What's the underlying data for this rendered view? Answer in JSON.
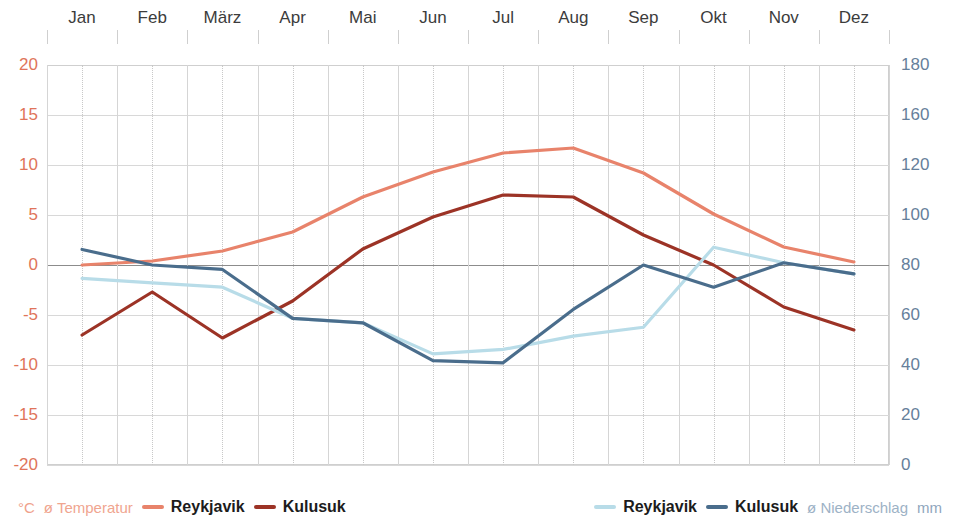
{
  "chart_data": {
    "type": "line",
    "title": "",
    "xlabel": "",
    "categories": [
      "Jan",
      "Feb",
      "März",
      "Apr",
      "Mai",
      "Jun",
      "Jul",
      "Aug",
      "Sep",
      "Okt",
      "Nov",
      "Dez"
    ],
    "left_axis": {
      "label": "°C",
      "caption": "ø Temperatur",
      "ticks": [
        20,
        15,
        10,
        5,
        0,
        -5,
        -10,
        -15,
        -20
      ],
      "ylim": [
        -20,
        20
      ],
      "color": "#e0745a"
    },
    "right_axis": {
      "label": "mm",
      "caption": "ø Niederschlag",
      "ticks": [
        180,
        160,
        120,
        100,
        80,
        60,
        40,
        20,
        0
      ],
      "ylim": [
        0,
        180
      ],
      "color": "#66809b"
    },
    "grid": true,
    "legend_position": "bottom",
    "series": [
      {
        "name": "Reykjavik",
        "axis": "left",
        "unit": "°C",
        "group": "ø Temperatur",
        "color": "#e8836b",
        "values": [
          0.0,
          0.4,
          1.4,
          3.3,
          6.8,
          9.3,
          11.2,
          11.7,
          9.2,
          5.1,
          1.8,
          0.3
        ]
      },
      {
        "name": "Kulusuk",
        "axis": "left",
        "unit": "°C",
        "group": "ø Temperatur",
        "color": "#9c3326",
        "values": [
          -7.0,
          -2.7,
          -7.3,
          -3.6,
          1.6,
          4.8,
          7.0,
          6.8,
          3.0,
          0.0,
          -4.2,
          -6.5
        ]
      },
      {
        "name": "Reykjavik",
        "axis": "right",
        "unit": "mm",
        "group": "ø Niederschlag",
        "color": "#b8dce8",
        "values": [
          84,
          82,
          80,
          66,
          64,
          50,
          52,
          58,
          62,
          98,
          91,
          86
        ]
      },
      {
        "name": "Kulusuk",
        "axis": "right",
        "unit": "mm",
        "group": "ø Niederschlag",
        "color": "#4a6d8c",
        "values": [
          97,
          90,
          88,
          66,
          64,
          47,
          46,
          70,
          90,
          80,
          91,
          86
        ]
      }
    ]
  },
  "legend": {
    "temperature": {
      "unit": "°C",
      "caption": "ø Temperatur",
      "items": [
        {
          "label": "Reykjavik",
          "color": "#e8836b"
        },
        {
          "label": "Kulusuk",
          "color": "#9c3326"
        }
      ]
    },
    "precipitation": {
      "unit": "mm",
      "caption": "ø Niederschlag",
      "items": [
        {
          "label": "Reykjavik",
          "color": "#b8dce8"
        },
        {
          "label": "Kulusuk",
          "color": "#4a6d8c"
        }
      ]
    }
  }
}
